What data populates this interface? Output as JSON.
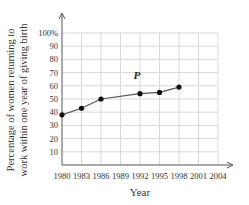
{
  "chart_data": {
    "type": "line",
    "title": "",
    "xlabel": "Year",
    "ylabel_line1": "Percentage of women returning to",
    "ylabel_line2": "work within one year of giving birth",
    "x": [
      1980,
      1983,
      1986,
      1992,
      1995,
      1998
    ],
    "values": [
      38,
      43,
      50,
      54,
      55,
      59
    ],
    "x_ticks": [
      "1980",
      "1983",
      "1986",
      "1989",
      "1992",
      "1995",
      "1998",
      "2001",
      "2004"
    ],
    "y_ticks": [
      "10",
      "20",
      "30",
      "40",
      "50",
      "60",
      "70",
      "80",
      "90",
      "100%"
    ],
    "xlim": [
      1980,
      2004
    ],
    "ylim": [
      0,
      100
    ],
    "grid": true,
    "legend": null,
    "annotations": [
      {
        "text": "P",
        "x": 1991,
        "y": 65
      }
    ],
    "colors": {
      "line": "#555555",
      "marker": "#111111",
      "grid": "#d9d9d9",
      "axis": "#555555"
    }
  }
}
